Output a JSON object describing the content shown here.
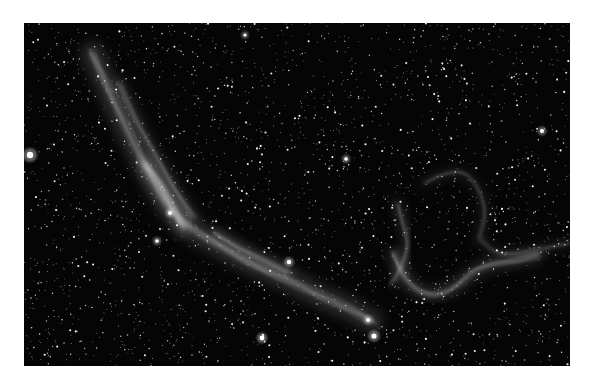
{
  "image": {
    "subject": "Veil Nebula (western filament and Pickering's Triangle region)",
    "description": "Monochrome astrophotograph of a dense starfield with faint supernova-remnant filaments",
    "frame": {
      "x": 24,
      "y": 23,
      "width": 546,
      "height": 343
    },
    "background_color": "#050505",
    "page_color": "#ffffff",
    "star_color": "#ffffff",
    "nebula_color": "#d8d8d8",
    "star_count": 2600,
    "bright_stars": [
      {
        "x": 6,
        "y": 132,
        "r": 3.2
      },
      {
        "x": 221,
        "y": 12,
        "r": 1.6
      },
      {
        "x": 265,
        "y": 239,
        "r": 2.2
      },
      {
        "x": 238,
        "y": 315,
        "r": 2.4
      },
      {
        "x": 146,
        "y": 190,
        "r": 2.0
      },
      {
        "x": 350,
        "y": 313,
        "r": 2.6
      },
      {
        "x": 344,
        "y": 297,
        "r": 2.0
      },
      {
        "x": 518,
        "y": 108,
        "r": 2.0
      },
      {
        "x": 322,
        "y": 136,
        "r": 1.8
      },
      {
        "x": 133,
        "y": 218,
        "r": 1.8
      }
    ],
    "filaments": [
      {
        "name": "western-veil-main",
        "points": [
          [
            68,
            30
          ],
          [
            86,
            70
          ],
          [
            104,
            110
          ],
          [
            124,
            150
          ],
          [
            148,
            190
          ],
          [
            172,
            210
          ],
          [
            200,
            225
          ],
          [
            225,
            240
          ],
          [
            250,
            250
          ],
          [
            275,
            262
          ],
          [
            300,
            275
          ],
          [
            325,
            285
          ],
          [
            348,
            298
          ]
        ],
        "width": 10,
        "opacity": 0.35
      },
      {
        "name": "western-veil-core",
        "points": [
          [
            120,
            140
          ],
          [
            135,
            160
          ],
          [
            150,
            185
          ],
          [
            160,
            205
          ]
        ],
        "width": 6,
        "opacity": 0.6
      },
      {
        "name": "western-veil-inner",
        "points": [
          [
            95,
            60
          ],
          [
            110,
            95
          ],
          [
            130,
            130
          ],
          [
            150,
            165
          ],
          [
            170,
            195
          ]
        ],
        "width": 5,
        "opacity": 0.3
      },
      {
        "name": "mid-streak",
        "points": [
          [
            190,
            210
          ],
          [
            215,
            225
          ],
          [
            240,
            238
          ],
          [
            265,
            250
          ]
        ],
        "width": 4,
        "opacity": 0.4
      },
      {
        "name": "pickering-arc",
        "points": [
          [
            370,
            230
          ],
          [
            380,
            255
          ],
          [
            395,
            270
          ],
          [
            415,
            272
          ],
          [
            435,
            262
          ],
          [
            450,
            248
          ],
          [
            470,
            240
          ],
          [
            490,
            238
          ],
          [
            515,
            232
          ]
        ],
        "width": 5,
        "opacity": 0.4
      },
      {
        "name": "pickering-left-loop",
        "points": [
          [
            372,
            180
          ],
          [
            380,
            200
          ],
          [
            385,
            222
          ],
          [
            378,
            245
          ],
          [
            368,
            260
          ]
        ],
        "width": 4,
        "opacity": 0.3
      },
      {
        "name": "pickering-upper",
        "points": [
          [
            400,
            160
          ],
          [
            420,
            150
          ],
          [
            440,
            148
          ],
          [
            455,
            165
          ],
          [
            462,
            190
          ],
          [
            455,
            215
          ]
        ],
        "width": 3,
        "opacity": 0.25
      },
      {
        "name": "pickering-right",
        "points": [
          [
            455,
            215
          ],
          [
            470,
            230
          ],
          [
            490,
            232
          ],
          [
            520,
            225
          ],
          [
            545,
            220
          ]
        ],
        "width": 3,
        "opacity": 0.25
      }
    ]
  }
}
